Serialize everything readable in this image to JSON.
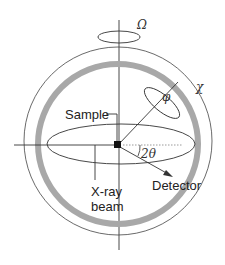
{
  "diagram": {
    "labels": {
      "omega": "Ω",
      "chi": "χ",
      "phi": "φ",
      "two_theta": "2θ",
      "sample": "Sample",
      "xray_line1": "X-ray",
      "xray_line2": "beam",
      "detector": "Detector"
    },
    "colors": {
      "line": "#333333",
      "ring": "#a8a8a8",
      "sample": "#111111",
      "dotted": "#9a9a9a",
      "background": "#ffffff"
    }
  }
}
